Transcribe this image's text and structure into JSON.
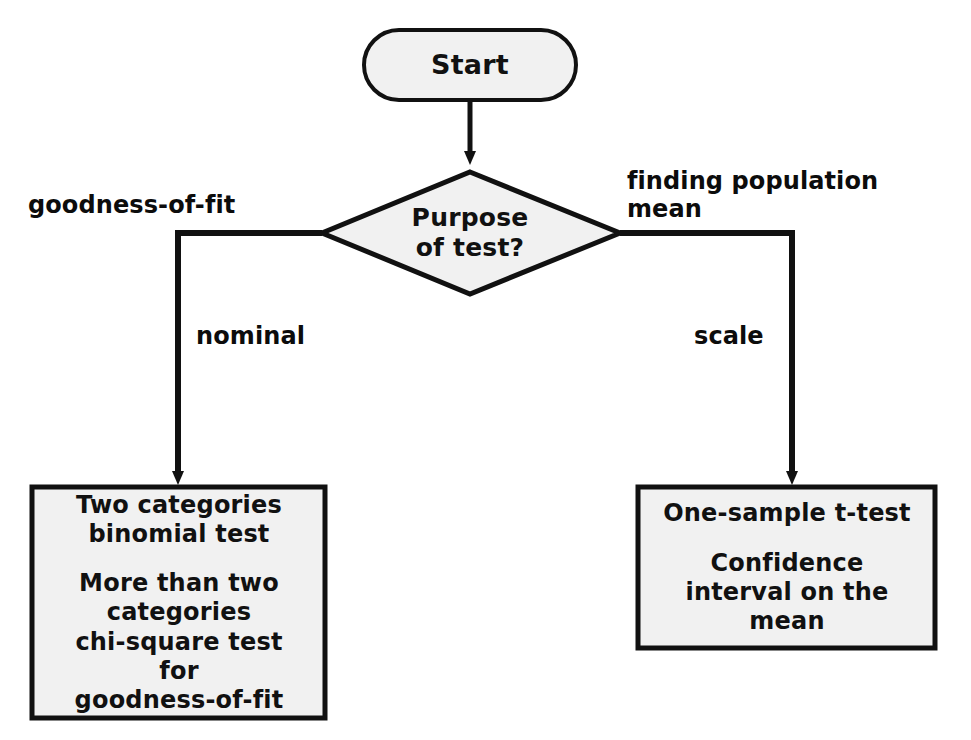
{
  "diagram": {
    "type": "flowchart",
    "colors": {
      "stroke": "#111111",
      "node_fill": "#f1f1f1",
      "text": "#111111",
      "background": "#ffffff"
    },
    "nodes": {
      "start": {
        "shape": "stadium",
        "label": "Start"
      },
      "decision": {
        "shape": "diamond",
        "label": "Purpose\nof test?"
      },
      "box_left": {
        "shape": "rectangle",
        "line1": "Two categories",
        "line2": "binomial test",
        "line3": "More than two",
        "line4": "categories",
        "line5": "chi-square test",
        "line6": "for",
        "line7": "goodness-of-fit"
      },
      "box_right": {
        "shape": "rectangle",
        "line1": "One-sample t-test",
        "line2": "Confidence",
        "line3": "interval on the",
        "line4": "mean"
      }
    },
    "edge_labels": {
      "goodness_of_fit": "goodness-of-fit",
      "finding_population_mean": "finding population\nmean",
      "nominal": "nominal",
      "scale": "scale"
    }
  }
}
